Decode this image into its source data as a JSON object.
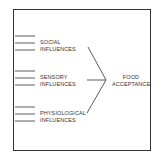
{
  "diagram": {
    "groups": [
      {
        "line1": "SOCIAL",
        "line2": "INFLUENCES"
      },
      {
        "line1": "SENSORY",
        "line2": "INFLUENCES"
      },
      {
        "line1": "PHYSIOLOGICAL",
        "line2": "INFLUENCES"
      }
    ],
    "outcome": {
      "line1": "FOOD",
      "line2": "ACCEPTANCE"
    },
    "colors": {
      "stroke": "#333333",
      "background": "#ffffff"
    }
  }
}
